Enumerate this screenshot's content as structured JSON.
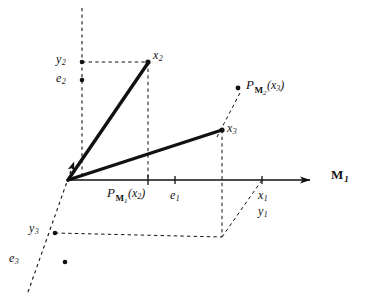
{
  "figure": {
    "background_color": "#ffffff",
    "ink_color": "#111111",
    "width": 381,
    "height": 296
  },
  "axes": [
    {
      "id": "m1",
      "label_main": "M",
      "label_sub": "1",
      "style": "solid-arrow",
      "from": [
        67,
        180
      ],
      "to": [
        318,
        180
      ],
      "label_pos": [
        331,
        168
      ]
    },
    {
      "id": "m2",
      "style": "dashed",
      "from": [
        82,
        8
      ],
      "to": [
        82,
        180
      ]
    },
    {
      "id": "m3",
      "style": "dashed-arrow",
      "from": [
        28,
        292
      ],
      "to": [
        76,
        157
      ]
    }
  ],
  "origin": [
    67,
    180
  ],
  "vectors": [
    {
      "id": "x2-vector",
      "from": [
        67,
        180
      ],
      "to": [
        148,
        62
      ],
      "width": 3.2
    },
    {
      "id": "x3-vector",
      "from": [
        67,
        180
      ],
      "to": [
        222,
        130
      ],
      "width": 3.2
    }
  ],
  "points": [
    {
      "id": "y2",
      "x": 82,
      "y": 62,
      "label": "y",
      "sub": "2",
      "label_pos": [
        58,
        54
      ]
    },
    {
      "id": "e2",
      "x": 82,
      "y": 80,
      "label": "e",
      "sub": "2",
      "label_pos": [
        58,
        72
      ]
    },
    {
      "id": "x2",
      "x": 148,
      "y": 62,
      "label": "x",
      "sub": "2",
      "label_pos": [
        153,
        50
      ]
    },
    {
      "id": "x3",
      "x": 222,
      "y": 130,
      "label": "x",
      "sub": "3",
      "label_pos": [
        227,
        124
      ]
    },
    {
      "id": "y3",
      "x": 55,
      "y": 233,
      "label": "y",
      "sub": "3",
      "label_pos": [
        30,
        224
      ]
    },
    {
      "id": "e3",
      "x": 65,
      "y": 262,
      "label": "e",
      "sub": "3",
      "label_pos": [
        10,
        253
      ]
    }
  ],
  "ticks": [
    {
      "id": "tick-pm1x2",
      "x": 148,
      "y": 180
    },
    {
      "id": "tick-e1",
      "x": 175,
      "y": 180
    },
    {
      "id": "tick-x1y1",
      "x": 262,
      "y": 180
    }
  ],
  "tick_labels": [
    {
      "id": "e1-label",
      "label": "e",
      "sub": "1",
      "pos": [
        172,
        190
      ]
    },
    {
      "id": "x1-label",
      "label": "x",
      "sub": "1",
      "pos": [
        258,
        190
      ]
    },
    {
      "id": "y1-label",
      "label": "y",
      "sub": "1",
      "pos": [
        258,
        206
      ]
    }
  ],
  "projection_labels": [
    {
      "id": "proj-m1-x2",
      "operator": "P",
      "subspace": "M",
      "subspace_index": "1",
      "argument": "x",
      "argument_index": "2",
      "text": "P_M1(x2)",
      "pos": [
        108,
        188
      ]
    },
    {
      "id": "proj-m2-x3",
      "operator": "P",
      "subspace": "M",
      "subspace_index": "2",
      "argument": "x",
      "argument_index": "3",
      "text": "P_M2(x3)",
      "pos": [
        246,
        80
      ],
      "dot": [
        238,
        88
      ]
    }
  ],
  "dashed_guides": [
    {
      "id": "guide-y2-to-x2",
      "from": [
        82,
        62
      ],
      "to": [
        148,
        62
      ]
    },
    {
      "id": "guide-x2-to-axis",
      "from": [
        148,
        62
      ],
      "to": [
        148,
        180
      ]
    },
    {
      "id": "guide-x3-to-base",
      "from": [
        222,
        130
      ],
      "to": [
        222,
        237
      ]
    },
    {
      "id": "guide-y3-to-base",
      "from": [
        55,
        233
      ],
      "to": [
        222,
        237
      ]
    },
    {
      "id": "guide-x3-to-projm2",
      "from": [
        218,
        136
      ],
      "to": [
        240,
        92
      ]
    },
    {
      "id": "guide-base-to-x1",
      "from": [
        222,
        237
      ],
      "to": [
        262,
        180
      ]
    }
  ]
}
